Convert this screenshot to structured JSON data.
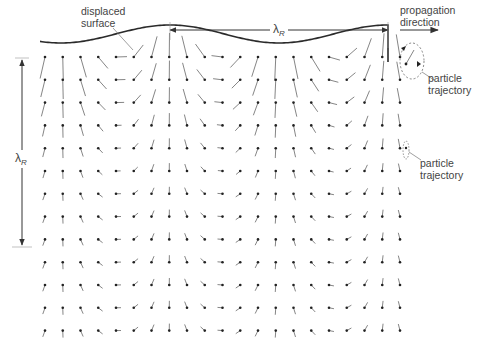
{
  "labels": {
    "displaced_surface_line1": "displaced",
    "displaced_surface_line2": "surface",
    "wavelength_symbol": "λ",
    "wavelength_subscript": "R",
    "propagation_line1": "propagation",
    "propagation_line2": "direction",
    "trajectory_top_line1": "particle",
    "trajectory_top_line2": "trajectory",
    "trajectory_mid_line1": "particle",
    "trajectory_mid_line2": "trajectory",
    "depth_symbol": "λ",
    "depth_subscript": "R"
  },
  "colors": {
    "ink": "#333333",
    "surface": "#2a2a2a",
    "stick": "#666666",
    "background": "#ffffff"
  },
  "grid": {
    "x0": 45,
    "dx": 17.75,
    "columns": 21,
    "y0": 57,
    "dy": 22.8,
    "rows": 13,
    "wavelength_px": 218,
    "crest_x": 170,
    "surface_amplitude_px": 9,
    "surface_mean_y": 26
  },
  "diagram": {
    "elements": [
      "displaced surface curve",
      "wavelength arrow λR",
      "propagation direction arrow",
      "particle displacement grid",
      "particle trajectory ellipses",
      "depth arrow λR"
    ]
  }
}
